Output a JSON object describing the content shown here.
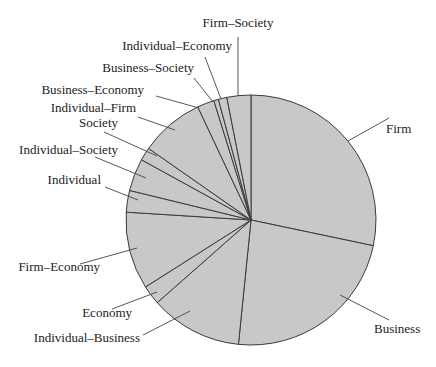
{
  "chart_data": {
    "type": "pie",
    "title": "",
    "start_angle_deg": 0,
    "direction": "clockwise",
    "fill_color": "#c8c8c8",
    "edge_color": "#3a3a3a",
    "label_color": "#222222",
    "legend": "none",
    "labels_as_callouts": true,
    "slices": [
      {
        "label": "Firm",
        "value": 28.3
      },
      {
        "label": "Business",
        "value": 23.3
      },
      {
        "label": "Individual–Business",
        "value": 11.9
      },
      {
        "label": "Economy",
        "value": 2.5
      },
      {
        "label": "Firm–Economy",
        "value": 10.0
      },
      {
        "label": "Individual",
        "value": 2.8
      },
      {
        "label": "Individual–Society",
        "value": 4.2
      },
      {
        "label": "Society",
        "value": 1.7
      },
      {
        "label": "Individual–Firm",
        "value": 8.3
      },
      {
        "label": "Business–Economy",
        "value": 2.2
      },
      {
        "label": "Business–Society",
        "value": 0.6
      },
      {
        "label": "Individual–Economy",
        "value": 1.1
      },
      {
        "label": "Firm–Society",
        "value": 3.1
      }
    ]
  },
  "layout": {
    "cx": 251,
    "cy": 220,
    "r": 125,
    "callouts": [
      {
        "label": "Firm",
        "text_x": 386,
        "text_y": 133,
        "anchor": "start",
        "line": [
          [
            348,
            141
          ],
          [
            389,
            118
          ]
        ]
      },
      {
        "label": "Business",
        "text_x": 374,
        "text_y": 333,
        "anchor": "start",
        "line": [
          [
            340,
            295
          ],
          [
            389,
            320
          ]
        ]
      },
      {
        "label": "Individual–Business",
        "text_x": 140,
        "text_y": 342,
        "anchor": "end",
        "line": [
          [
            143,
            335
          ],
          [
            190,
            311
          ]
        ]
      },
      {
        "label": "Economy",
        "text_x": 132,
        "text_y": 317,
        "anchor": "end",
        "line": [
          [
            112,
            309
          ],
          [
            157,
            292
          ]
        ]
      },
      {
        "label": "Firm–Economy",
        "text_x": 100,
        "text_y": 271,
        "anchor": "end",
        "line": [
          [
            80,
            264
          ],
          [
            137,
            248
          ]
        ]
      },
      {
        "label": "Individual",
        "text_x": 101,
        "text_y": 184,
        "anchor": "end",
        "line": [
          [
            105,
            187
          ],
          [
            138,
            200
          ]
        ]
      },
      {
        "label": "Individual–Society",
        "text_x": 118,
        "text_y": 154,
        "anchor": "end",
        "line": [
          [
            95,
            157
          ],
          [
            146,
            178
          ]
        ]
      },
      {
        "label": "Society",
        "text_x": 118,
        "text_y": 127,
        "anchor": "end",
        "line": [
          [
            104,
            132
          ],
          [
            157,
            156
          ]
        ]
      },
      {
        "label": "Individual–Firm",
        "text_x": 136,
        "text_y": 112,
        "anchor": "end",
        "line": [
          [
            138,
            117
          ],
          [
            175,
            130
          ]
        ]
      },
      {
        "label": "Business–Economy",
        "text_x": 144,
        "text_y": 94,
        "anchor": "end",
        "line": [
          [
            156,
            96
          ],
          [
            199,
            108
          ]
        ]
      },
      {
        "label": "Business–Society",
        "text_x": 194,
        "text_y": 72,
        "anchor": "end",
        "line": [
          [
            194,
            78
          ],
          [
            213,
            102
          ]
        ]
      },
      {
        "label": "Individual–Economy",
        "text_x": 232,
        "text_y": 50,
        "anchor": "end",
        "line": [
          [
            205,
            57
          ],
          [
            221,
            99
          ]
        ]
      },
      {
        "label": "Firm–Society",
        "text_x": 238,
        "text_y": 27,
        "anchor": "middle",
        "line": [
          [
            238,
            37
          ],
          [
            238,
            96
          ]
        ]
      }
    ]
  }
}
